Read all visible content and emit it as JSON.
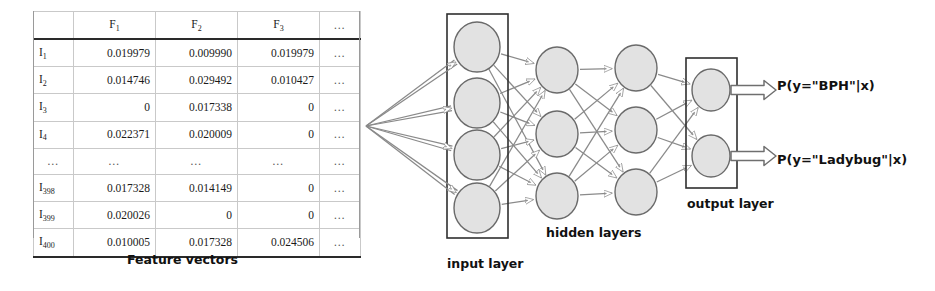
{
  "figure": {
    "captions": {
      "feature_vectors": "Feature vectors",
      "input_layer": "input layer",
      "hidden_layers": "hidden layers",
      "output_layer": "output layer"
    },
    "output_labels": [
      "P(y=\"BPH\"|x)",
      "P(y=\"Ladybug\"|x)"
    ],
    "colors": {
      "node_fill": "#e2e2e2",
      "node_stroke": "#6a6a6a",
      "edge": "#8a8a8a",
      "box_stroke": "#2f2f2f",
      "text": "#111111",
      "table_rule": "#2a2a2a",
      "table_grid": "#c9c9c9"
    },
    "layers": {
      "input_nodes": 4,
      "hidden_layer_1_nodes": 3,
      "hidden_layer_2_nodes": 3,
      "output_nodes": 2
    }
  },
  "table": {
    "headers": [
      "",
      "F1",
      "F2",
      "F3",
      "…"
    ],
    "header_parts": [
      {
        "base": "",
        "sub": ""
      },
      {
        "base": "F",
        "sub": "1"
      },
      {
        "base": "F",
        "sub": "2"
      },
      {
        "base": "F",
        "sub": "3"
      },
      {
        "base": "…",
        "sub": ""
      }
    ],
    "rows": [
      {
        "index_base": "I",
        "index_sub": "1",
        "values": [
          "0.019979",
          "0.009990",
          "0.019979"
        ],
        "dots": "…"
      },
      {
        "index_base": "I",
        "index_sub": "2",
        "values": [
          "0.014746",
          "0.029492",
          "0.010427"
        ],
        "dots": "…"
      },
      {
        "index_base": "I",
        "index_sub": "3",
        "values": [
          "0",
          "0.017338",
          "0"
        ],
        "dots": "…"
      },
      {
        "index_base": "I",
        "index_sub": "4",
        "values": [
          "0.022371",
          "0.020009",
          "0"
        ],
        "dots": "…"
      },
      {
        "index_base": "…",
        "index_sub": "",
        "values": [
          "…",
          "…",
          "…"
        ],
        "dots": "…",
        "ellipsis": true
      },
      {
        "index_base": "I",
        "index_sub": "398",
        "values": [
          "0.017328",
          "0.014149",
          "0"
        ],
        "dots": "…"
      },
      {
        "index_base": "I",
        "index_sub": "399",
        "values": [
          "0.020026",
          "0",
          "0"
        ],
        "dots": "…"
      },
      {
        "index_base": "I",
        "index_sub": "400",
        "values": [
          "0.010005",
          "0.017328",
          "0.024506"
        ],
        "dots": "…"
      }
    ]
  }
}
